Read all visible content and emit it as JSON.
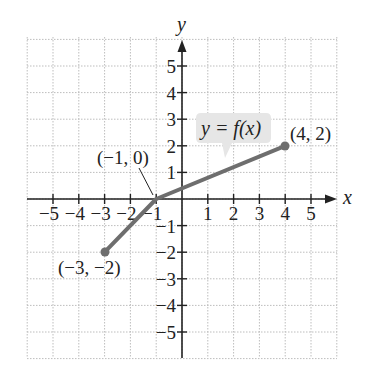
{
  "chart_data": {
    "type": "line",
    "title": "",
    "xlabel": "x",
    "ylabel": "y",
    "xlim": [
      -6,
      6
    ],
    "ylim": [
      -6,
      6
    ],
    "grid": true,
    "x_ticks": [
      "-5",
      "-4",
      "-3",
      "-2",
      "-1",
      "1",
      "2",
      "3",
      "4",
      "5"
    ],
    "y_ticks": [
      "5",
      "4",
      "3",
      "2",
      "1",
      "-1",
      "-2",
      "-3",
      "-4",
      "-5"
    ],
    "series": [
      {
        "name": "y = f(x)",
        "x": [
          -3,
          -1,
          4
        ],
        "y": [
          -2,
          0,
          2
        ],
        "color": "#6e6e6e"
      }
    ],
    "annotations": [
      {
        "text": "(-3, -2)",
        "x": -3,
        "y": -2
      },
      {
        "text": "(-1, 0)",
        "x": -1,
        "y": 0
      },
      {
        "text": "(4, 2)",
        "x": 4,
        "y": 2
      },
      {
        "text": "y = f(x)",
        "type": "callout"
      }
    ]
  },
  "labels": {
    "x_axis": "x",
    "y_axis": "y",
    "function": "y = f(x)",
    "pt_a": "(−3, −2)",
    "pt_b": "(−1, 0)",
    "pt_c": "(4, 2)",
    "xt": [
      "−5",
      "−4",
      "−3",
      "−2",
      "−1",
      "1",
      "2",
      "3",
      "4",
      "5"
    ],
    "yt": [
      "5",
      "4",
      "3",
      "2",
      "1",
      "−1",
      "−2",
      "−3",
      "−4",
      "−5"
    ]
  }
}
